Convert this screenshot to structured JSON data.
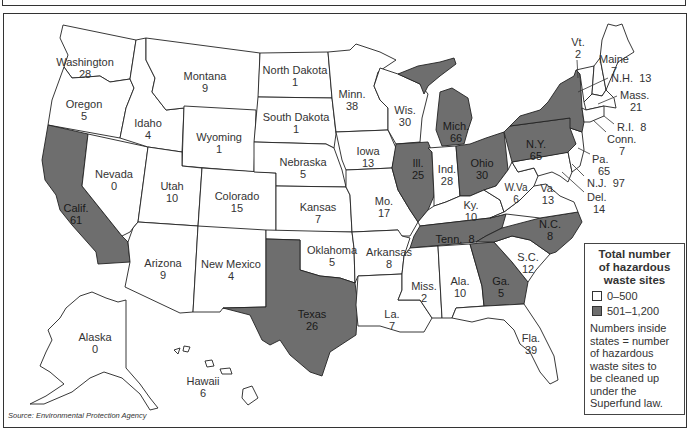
{
  "map": {
    "title": "Hazardous waste sites by state (Superfund)",
    "colors": {
      "low": "#ffffff",
      "high": "#6e6e6e",
      "border": "#222222"
    },
    "states": [
      {
        "name": "Washington",
        "value": "28",
        "category": "0-500"
      },
      {
        "name": "Oregon",
        "value": "5",
        "category": "0-500"
      },
      {
        "name": "Calif.",
        "value": "61",
        "category": "501-1,200"
      },
      {
        "name": "Idaho",
        "value": "4",
        "category": "0-500"
      },
      {
        "name": "Nevada",
        "value": "0",
        "category": "0-500"
      },
      {
        "name": "Montana",
        "value": "9",
        "category": "0-500"
      },
      {
        "name": "Wyoming",
        "value": "1",
        "category": "0-500"
      },
      {
        "name": "Utah",
        "value": "10",
        "category": "0-500"
      },
      {
        "name": "Arizona",
        "value": "9",
        "category": "0-500"
      },
      {
        "name": "Colorado",
        "value": "15",
        "category": "0-500"
      },
      {
        "name": "New Mexico",
        "value": "4",
        "category": "0-500"
      },
      {
        "name": "North Dakota",
        "value": "1",
        "category": "0-500"
      },
      {
        "name": "South Dakota",
        "value": "1",
        "category": "0-500"
      },
      {
        "name": "Nebraska",
        "value": "5",
        "category": "0-500"
      },
      {
        "name": "Kansas",
        "value": "7",
        "category": "0-500"
      },
      {
        "name": "Oklahoma",
        "value": "5",
        "category": "0-500"
      },
      {
        "name": "Texas",
        "value": "26",
        "category": "501-1,200"
      },
      {
        "name": "Minn.",
        "value": "38",
        "category": "0-500"
      },
      {
        "name": "Iowa",
        "value": "13",
        "category": "0-500"
      },
      {
        "name": "Mo.",
        "value": "17",
        "category": "0-500"
      },
      {
        "name": "Arkansas",
        "value": "8",
        "category": "0-500"
      },
      {
        "name": "La.",
        "value": "7",
        "category": "0-500"
      },
      {
        "name": "Wis.",
        "value": "30",
        "category": "0-500"
      },
      {
        "name": "Ill.",
        "value": "25",
        "category": "501-1,200"
      },
      {
        "name": "Mich.",
        "value": "66",
        "category": "501-1,200"
      },
      {
        "name": "Ind.",
        "value": "28",
        "category": "0-500"
      },
      {
        "name": "Ohio",
        "value": "30",
        "category": "501-1,200"
      },
      {
        "name": "Ky.",
        "value": "10",
        "category": "0-500"
      },
      {
        "name": "Tenn.",
        "value": "8",
        "category": "501-1,200"
      },
      {
        "name": "Miss.",
        "value": "2",
        "category": "0-500"
      },
      {
        "name": "Ala.",
        "value": "10",
        "category": "0-500"
      },
      {
        "name": "Ga.",
        "value": "5",
        "category": "501-1,200"
      },
      {
        "name": "Fla.",
        "value": "39",
        "category": "0-500"
      },
      {
        "name": "S.C.",
        "value": "12",
        "category": "0-500"
      },
      {
        "name": "N.C.",
        "value": "8",
        "category": "501-1,200"
      },
      {
        "name": "Va.",
        "value": "13",
        "category": "0-500"
      },
      {
        "name": "W.Va",
        "value": "6",
        "category": "0-500"
      },
      {
        "name": "Md.",
        "value": "8",
        "category": "0-500"
      },
      {
        "name": "Del.",
        "value": "14",
        "category": "0-500"
      },
      {
        "name": "N.J.",
        "value": "97",
        "category": "0-500"
      },
      {
        "name": "Pa.",
        "value": "65",
        "category": "501-1,200"
      },
      {
        "name": "N.Y.",
        "value": "65",
        "category": "501-1,200"
      },
      {
        "name": "Vt.",
        "value": "2",
        "category": "0-500"
      },
      {
        "name": "N.H.",
        "value": "13",
        "category": "0-500"
      },
      {
        "name": "Maine",
        "value": "7",
        "category": "0-500"
      },
      {
        "name": "Mass.",
        "value": "21",
        "category": "0-500"
      },
      {
        "name": "R.I.",
        "value": "8",
        "category": "0-500"
      },
      {
        "name": "Conn.",
        "value": "7",
        "category": "0-500"
      },
      {
        "name": "Alaska",
        "value": "0",
        "category": "0-500"
      },
      {
        "name": "Hawaii",
        "value": "6",
        "category": "0-500"
      }
    ]
  },
  "legend": {
    "title": "Total number of hazardous waste sites",
    "title_lines": [
      "Total number",
      "of hazardous",
      "waste sites"
    ],
    "items": [
      {
        "label": "0–500",
        "color": "#ffffff"
      },
      {
        "label": "501–1,200",
        "color": "#6e6e6e"
      }
    ],
    "note_lines": [
      "Numbers inside",
      "states = number",
      "of hazardous",
      "waste sites to",
      "be cleaned up",
      "under the",
      "Superfund law."
    ]
  },
  "source": "Source: Environmental Protection Agency"
}
